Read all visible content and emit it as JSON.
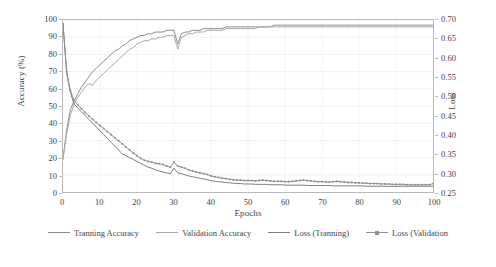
{
  "chart_data": {
    "type": "line",
    "title": "",
    "xlabel": "Epochs",
    "ylabel": "Accuracy (%)",
    "ylabel_secondary": "Loss",
    "grid": true,
    "legend_position": "bottom",
    "xlim": [
      0,
      100
    ],
    "ylim": [
      0,
      100
    ],
    "ylim_secondary": [
      0.25,
      0.7
    ],
    "x_ticks": [
      "0",
      "10",
      "20",
      "30",
      "40",
      "50",
      "60",
      "70",
      "80",
      "90",
      "100"
    ],
    "y_ticks_left": [
      "0",
      "10",
      "20",
      "30",
      "40",
      "50",
      "60",
      "70",
      "80",
      "90",
      "100"
    ],
    "y_ticks_right": [
      "0.25",
      "0.30",
      "0.35",
      "0.40",
      "0.45",
      "0.50",
      "0.55",
      "0.60",
      "0.65",
      "0.70"
    ],
    "x": [
      0,
      1,
      2,
      3,
      4,
      5,
      6,
      7,
      8,
      9,
      10,
      11,
      12,
      13,
      14,
      15,
      16,
      17,
      18,
      19,
      20,
      21,
      22,
      23,
      24,
      25,
      26,
      27,
      28,
      29,
      30,
      31,
      32,
      33,
      34,
      35,
      36,
      37,
      38,
      39,
      40,
      41,
      42,
      43,
      44,
      45,
      46,
      47,
      48,
      49,
      50,
      51,
      52,
      53,
      54,
      55,
      56,
      57,
      58,
      59,
      60,
      61,
      62,
      63,
      64,
      65,
      66,
      67,
      68,
      69,
      70,
      71,
      72,
      73,
      74,
      75,
      76,
      77,
      78,
      79,
      80,
      81,
      82,
      83,
      84,
      85,
      86,
      87,
      88,
      89,
      90,
      91,
      92,
      93,
      94,
      95,
      96,
      97,
      98,
      99,
      100
    ],
    "series": [
      {
        "name": "Tranning Accuracy",
        "axis": "left",
        "color": "#8c8c8c",
        "marker": "none",
        "values": [
          19,
          36,
          48,
          53,
          57,
          61,
          64,
          67,
          70,
          72,
          74,
          76,
          78,
          80,
          82,
          83,
          85,
          86,
          88,
          89,
          90,
          91,
          91,
          92,
          92,
          93,
          93,
          93,
          94,
          94,
          94,
          86,
          92,
          93,
          93,
          94,
          94,
          94,
          95,
          95,
          95,
          95,
          95,
          95,
          96,
          96,
          96,
          96,
          96,
          96,
          96,
          96,
          96,
          96,
          96,
          96,
          96,
          97,
          97,
          97,
          97,
          97,
          97,
          97,
          97,
          97,
          97,
          97,
          97,
          97,
          97,
          97,
          97,
          97,
          97,
          97,
          97,
          97,
          97,
          97,
          97,
          97,
          97,
          97,
          97,
          97,
          97,
          97,
          97,
          97,
          97,
          97,
          97,
          97,
          97,
          97,
          97,
          97,
          97,
          97,
          97
        ]
      },
      {
        "name": "Validation Accuracy",
        "axis": "left",
        "color": "#a8a8a8",
        "marker": "none",
        "values": [
          20,
          34,
          45,
          51,
          55,
          58,
          61,
          63,
          62,
          65,
          67,
          69,
          71,
          73,
          75,
          77,
          79,
          81,
          83,
          84,
          86,
          87,
          88,
          88,
          89,
          89,
          90,
          90,
          91,
          91,
          91,
          83,
          90,
          91,
          92,
          92,
          93,
          93,
          93,
          94,
          94,
          94,
          94,
          94,
          95,
          95,
          95,
          95,
          95,
          95,
          95,
          95,
          95,
          96,
          96,
          96,
          96,
          96,
          96,
          96,
          96,
          96,
          96,
          96,
          96,
          96,
          96,
          96,
          96,
          96,
          96,
          96,
          96,
          96,
          96,
          96,
          96,
          96,
          96,
          96,
          96,
          96,
          96,
          96,
          96,
          96,
          96,
          96,
          96,
          96,
          96,
          96,
          96,
          96,
          96,
          96,
          96,
          96,
          96,
          96,
          96
        ]
      },
      {
        "name": "Loss (Tranning)",
        "axis": "right",
        "color": "#7a7a7a",
        "marker": "none",
        "values": [
          0.69,
          0.56,
          0.51,
          0.48,
          0.47,
          0.46,
          0.45,
          0.44,
          0.43,
          0.42,
          0.41,
          0.4,
          0.39,
          0.38,
          0.37,
          0.36,
          0.35,
          0.345,
          0.34,
          0.335,
          0.33,
          0.325,
          0.32,
          0.315,
          0.312,
          0.308,
          0.305,
          0.302,
          0.3,
          0.298,
          0.312,
          0.3,
          0.298,
          0.295,
          0.292,
          0.29,
          0.288,
          0.286,
          0.284,
          0.282,
          0.28,
          0.278,
          0.277,
          0.276,
          0.275,
          0.274,
          0.273,
          0.272,
          0.272,
          0.271,
          0.271,
          0.271,
          0.27,
          0.27,
          0.27,
          0.27,
          0.269,
          0.269,
          0.269,
          0.269,
          0.268,
          0.268,
          0.268,
          0.268,
          0.268,
          0.268,
          0.267,
          0.267,
          0.267,
          0.267,
          0.267,
          0.267,
          0.267,
          0.266,
          0.266,
          0.266,
          0.266,
          0.266,
          0.266,
          0.266,
          0.266,
          0.266,
          0.265,
          0.265,
          0.265,
          0.265,
          0.265,
          0.265,
          0.265,
          0.265,
          0.265,
          0.265,
          0.265,
          0.265,
          0.265,
          0.265,
          0.265,
          0.265,
          0.265,
          0.265,
          0.265
        ]
      },
      {
        "name": "Loss (Validation",
        "axis": "right",
        "color": "#8f8f8f",
        "marker": "square",
        "values": [
          0.69,
          0.565,
          0.515,
          0.49,
          0.478,
          0.468,
          0.458,
          0.449,
          0.44,
          0.432,
          0.424,
          0.416,
          0.408,
          0.4,
          0.392,
          0.384,
          0.376,
          0.368,
          0.36,
          0.352,
          0.345,
          0.338,
          0.333,
          0.33,
          0.328,
          0.325,
          0.324,
          0.322,
          0.318,
          0.315,
          0.328,
          0.318,
          0.315,
          0.312,
          0.308,
          0.305,
          0.302,
          0.3,
          0.298,
          0.296,
          0.292,
          0.29,
          0.288,
          0.286,
          0.285,
          0.283,
          0.282,
          0.281,
          0.281,
          0.28,
          0.28,
          0.28,
          0.279,
          0.28,
          0.281,
          0.28,
          0.279,
          0.278,
          0.278,
          0.278,
          0.277,
          0.277,
          0.278,
          0.279,
          0.28,
          0.281,
          0.28,
          0.279,
          0.278,
          0.277,
          0.277,
          0.276,
          0.276,
          0.277,
          0.278,
          0.277,
          0.276,
          0.275,
          0.275,
          0.274,
          0.274,
          0.273,
          0.273,
          0.272,
          0.272,
          0.272,
          0.271,
          0.271,
          0.271,
          0.27,
          0.27,
          0.27,
          0.27,
          0.269,
          0.269,
          0.269,
          0.269,
          0.269,
          0.269,
          0.269,
          0.272
        ]
      }
    ]
  },
  "legend": {
    "items": [
      {
        "label": "Tranning Accuracy"
      },
      {
        "label": "Validation Accuracy"
      },
      {
        "label": "Loss (Tranning)"
      },
      {
        "label": "Loss (Validation"
      }
    ]
  },
  "colors": {
    "grid": "#e8e8e8",
    "frame": "#b9b9b9",
    "text": "#3f3f3f",
    "background": "#ffffff"
  }
}
